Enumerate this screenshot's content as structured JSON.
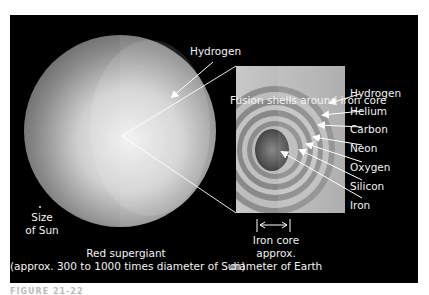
{
  "diagram": {
    "title": "Fusion shells around iron core",
    "star": {
      "label_line1": "Red supergiant",
      "label_line2": "(approx. 300 to 1000 times diameter of Sun)",
      "envelope_label": "Hydrogen",
      "sun_label_line1": "Size",
      "sun_label_line2": "of Sun"
    },
    "shells": [
      {
        "label": "Hydrogen"
      },
      {
        "label": "Helium"
      },
      {
        "label": "Carbon"
      },
      {
        "label": "Neon"
      },
      {
        "label": "Oxygen"
      },
      {
        "label": "Silicon"
      },
      {
        "label": "Iron"
      }
    ],
    "core_scale": {
      "line1": "Iron core",
      "line2": "approx.",
      "line3": "diameter of Earth"
    },
    "caption": "FIGURE 21-22"
  },
  "colors": {
    "background": "#000000",
    "label_text": "#f2f2f2",
    "star_light": "#e8e8e8",
    "star_dark": "#6e6e6e"
  }
}
